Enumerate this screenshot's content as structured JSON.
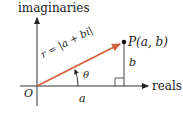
{
  "diagram": {
    "axes": {
      "vertical_label": "imaginaries",
      "horizontal_label": "reals"
    },
    "origin_label": "O",
    "point_label": "P(a, b)",
    "vector_label": "r = |a + bi|",
    "angle_label": "θ",
    "horizontal_leg_label": "a",
    "vertical_leg_label": "b",
    "colors": {
      "vector": "#d4613e",
      "axes": "#333333",
      "text": "#222222"
    },
    "geometry": {
      "origin": [
        37,
        86
      ],
      "point": [
        124,
        42
      ],
      "vertical_axis": {
        "x": 37,
        "y_top": 16,
        "y_bottom": 106
      },
      "horizontal_axis": {
        "y": 86,
        "x_left": 20,
        "x_right": 150
      }
    }
  }
}
